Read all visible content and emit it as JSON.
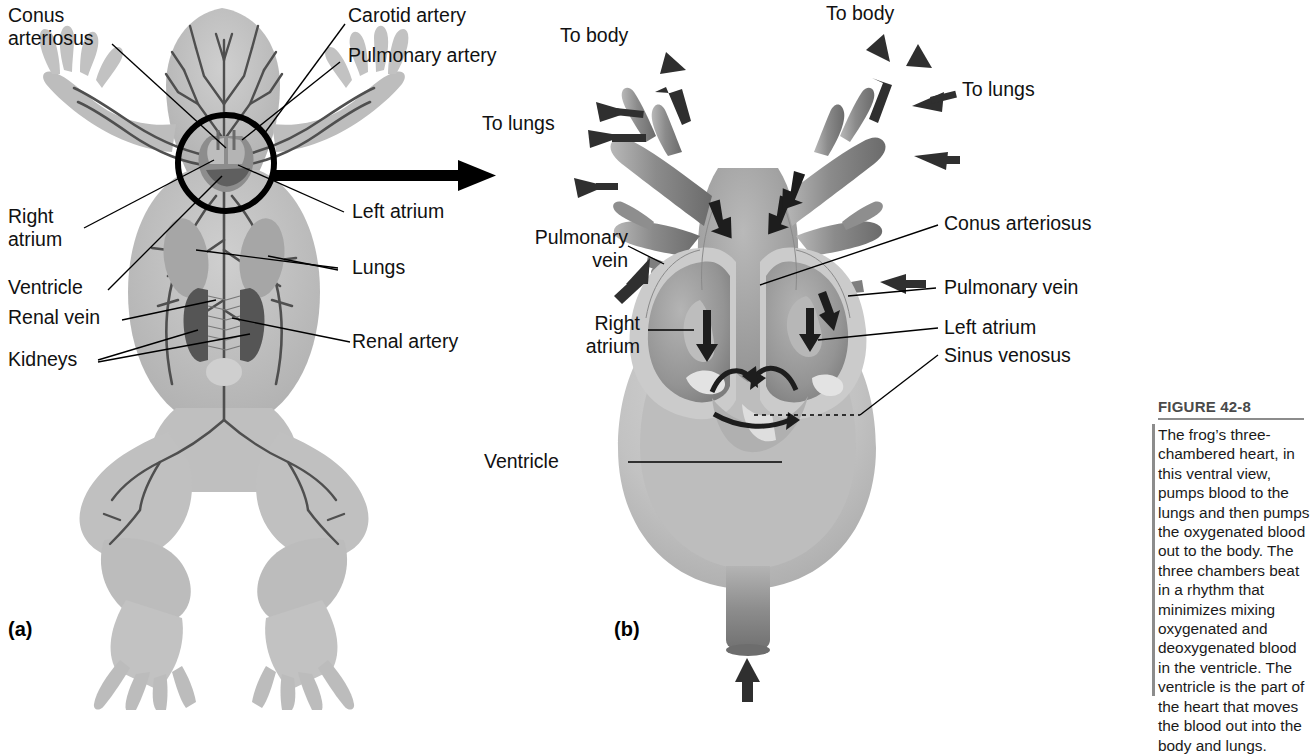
{
  "figure": {
    "number": "FIGURE 42-8",
    "caption": "The frog’s three-chambered heart, in this ventral view, pumps blood to the lungs and then pumps the oxygenated blood out to the body. The three chambers beat in a rhythm that minimizes mixing oxygenated and deoxygenated blood in the ventricle. The ventricle is the part of the heart that moves the blood out into the body and lungs."
  },
  "panel_a": {
    "id": "(a)",
    "title": "Frog circulatory system, ventral view",
    "labels": {
      "conus_arteriosus": "Conus\narteriosus",
      "carotid_artery": "Carotid artery",
      "pulmonary_artery": "Pulmonary artery",
      "left_atrium": "Left atrium",
      "right_atrium": "Right\natrium",
      "ventricle": "Ventricle",
      "lungs": "Lungs",
      "renal_vein": "Renal vein",
      "renal_artery": "Renal artery",
      "kidneys": "Kidneys"
    }
  },
  "panel_b": {
    "id": "(b)",
    "title": "Frog three-chambered heart, enlarged",
    "labels": {
      "to_body_left": "To body",
      "to_body_right": "To body",
      "to_lungs_left": "To lungs",
      "to_lungs_right": "To lungs",
      "pulmonary_vein_left": "Pulmonary\nvein",
      "pulmonary_vein_right": "Pulmonary vein",
      "conus_arteriosus": "Conus arteriosus",
      "left_atrium": "Left atrium",
      "sinus_venosus": "Sinus venosus",
      "right_atrium": "Right\natrium",
      "ventricle": "Ventricle"
    }
  },
  "colors": {
    "ink": "#111111",
    "rule": "#8c8c8c",
    "figure_number": "#4a4a4a",
    "art_mid": "#a9a9a9",
    "art_light": "#c9c9c9",
    "art_dark": "#767676"
  }
}
